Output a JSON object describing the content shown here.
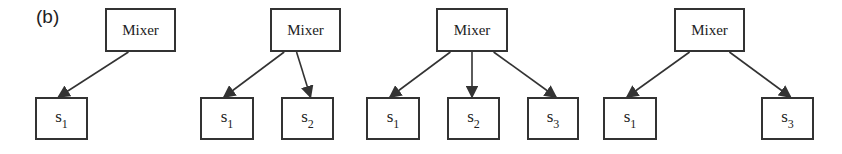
{
  "figure_label": "(b)",
  "diagrams": [
    {
      "mixer": {
        "label": "Mixer",
        "x": 105,
        "y": 8,
        "w": 71,
        "h": 44
      },
      "sources": [
        {
          "base": "s",
          "sub": "1",
          "x": 35,
          "y": 97,
          "w": 53,
          "h": 43
        }
      ]
    },
    {
      "mixer": {
        "label": "Mixer",
        "x": 270,
        "y": 8,
        "w": 71,
        "h": 44
      },
      "sources": [
        {
          "base": "s",
          "sub": "1",
          "x": 200,
          "y": 97,
          "w": 54,
          "h": 43
        },
        {
          "base": "s",
          "sub": "2",
          "x": 281,
          "y": 97,
          "w": 53,
          "h": 43
        }
      ]
    },
    {
      "mixer": {
        "label": "Mixer",
        "x": 436,
        "y": 8,
        "w": 72,
        "h": 44
      },
      "sources": [
        {
          "base": "s",
          "sub": "1",
          "x": 366,
          "y": 97,
          "w": 54,
          "h": 43
        },
        {
          "base": "s",
          "sub": "2",
          "x": 447,
          "y": 97,
          "w": 53,
          "h": 43
        },
        {
          "base": "s",
          "sub": "3",
          "x": 527,
          "y": 97,
          "w": 52,
          "h": 43
        }
      ]
    },
    {
      "mixer": {
        "label": "Mixer",
        "x": 674,
        "y": 8,
        "w": 71,
        "h": 44
      },
      "sources": [
        {
          "base": "s",
          "sub": "1",
          "x": 603,
          "y": 97,
          "w": 54,
          "h": 43
        },
        {
          "base": "s",
          "sub": "3",
          "x": 761,
          "y": 97,
          "w": 53,
          "h": 43
        }
      ]
    }
  ],
  "colors": {
    "stroke": "#333333",
    "background": "#ffffff",
    "text": "#222222"
  }
}
